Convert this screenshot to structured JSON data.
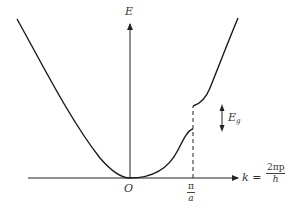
{
  "diagram": {
    "axes": {
      "y_label": "E",
      "origin_label": "O",
      "x_label_prefix": "k =",
      "x_label_fraction": {
        "numerator": "2πp",
        "denominator": "h"
      }
    },
    "marker": {
      "tick_fraction": {
        "numerator": "π",
        "denominator": "a"
      }
    },
    "gap": {
      "label_main": "E",
      "label_sub": "g"
    },
    "colors": {
      "curve": "#1a1a1a",
      "axis": "#222222",
      "text": "#333333",
      "background": "#ffffff"
    }
  }
}
